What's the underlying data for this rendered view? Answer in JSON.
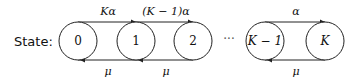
{
  "diagram": {
    "type": "birth-death-markov-chain",
    "prefix_label": "State:",
    "ellipsis": "···",
    "nodes": [
      {
        "id": "0",
        "label": "0",
        "italic": false,
        "cx": 78
      },
      {
        "id": "1",
        "label": "1",
        "italic": false,
        "cx": 136
      },
      {
        "id": "2",
        "label": "2",
        "italic": false,
        "cx": 193
      },
      {
        "id": "K-1",
        "label": "K − 1",
        "italic": true,
        "cx": 265
      },
      {
        "id": "K",
        "label": "K",
        "italic": true,
        "cx": 325
      }
    ],
    "forward_edges": [
      {
        "from": "0",
        "to": "1",
        "label": "Kα"
      },
      {
        "from": "1",
        "to": "2",
        "label": "(K − 1)α"
      },
      {
        "from": "K-1",
        "to": "K",
        "label": "α"
      }
    ],
    "backward_edges": [
      {
        "from": "1",
        "to": "0",
        "label": "μ"
      },
      {
        "from": "2",
        "to": "1",
        "label": "μ"
      },
      {
        "from": "K",
        "to": "K-1",
        "label": "μ"
      }
    ]
  }
}
